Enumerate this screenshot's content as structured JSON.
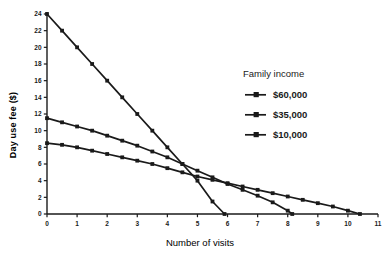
{
  "chart_data": {
    "type": "line",
    "title": "",
    "xlabel": "Number of visits",
    "ylabel": "Day use fee ($)",
    "xlim": [
      0,
      11
    ],
    "ylim": [
      0,
      24
    ],
    "xticks": [
      0,
      1,
      2,
      3,
      4,
      5,
      6,
      7,
      8,
      9,
      10,
      11
    ],
    "xticklabels": [
      "0",
      "1",
      "2",
      "3",
      "4",
      "5",
      "6",
      "7",
      "8",
      "9",
      "10",
      "11"
    ],
    "yticks": [
      0,
      2,
      4,
      6,
      8,
      10,
      12,
      14,
      16,
      18,
      20,
      22,
      24
    ],
    "yticklabels": [
      "0",
      "2",
      "4",
      "6",
      "8",
      "10",
      "12",
      "14",
      "16",
      "18",
      "20",
      "22",
      "24"
    ],
    "grid": false,
    "legend_position": "center-right",
    "legend_title": "Family income",
    "marker": "square",
    "series": [
      {
        "name": "$60,000",
        "x": [
          0,
          0.5,
          1,
          1.5,
          2,
          2.5,
          3,
          3.5,
          4,
          4.5,
          5,
          5.5,
          6,
          6.5,
          7,
          7.5,
          8,
          8.5,
          9,
          9.5,
          10,
          10.4
        ],
        "values": [
          8.5,
          8.3,
          8.0,
          7.6,
          7.2,
          6.8,
          6.4,
          6.0,
          5.5,
          5.0,
          4.5,
          4.1,
          3.7,
          3.3,
          2.9,
          2.5,
          2.1,
          1.7,
          1.3,
          0.9,
          0.4,
          0.0
        ]
      },
      {
        "name": "$35,000",
        "x": [
          0,
          0.5,
          1,
          1.5,
          2,
          2.5,
          3,
          3.5,
          4,
          4.5,
          5,
          5.5,
          6,
          6.5,
          7,
          7.5,
          8,
          8.15
        ],
        "values": [
          11.5,
          11.0,
          10.5,
          10.0,
          9.4,
          8.8,
          8.2,
          7.5,
          6.8,
          6.0,
          5.2,
          4.4,
          3.6,
          2.9,
          2.2,
          1.4,
          0.4,
          0.0
        ]
      },
      {
        "name": "$10,000",
        "x": [
          0,
          0.5,
          1,
          1.5,
          2,
          2.5,
          3,
          3.5,
          4,
          4.5,
          5,
          5.5,
          5.9
        ],
        "values": [
          24.0,
          22.0,
          20.0,
          18.0,
          16.0,
          14.0,
          12.0,
          10.0,
          8.0,
          6.0,
          4.0,
          1.5,
          0.0
        ]
      }
    ]
  },
  "legend": {
    "title": "Family income",
    "entries": [
      {
        "label": "$60,000"
      },
      {
        "label": "$35,000"
      },
      {
        "label": "$10,000"
      }
    ]
  },
  "axes": {
    "x_title": "Number of visits",
    "y_title": "Day use fee ($)"
  },
  "colors": {
    "line": "#1a1a1a",
    "text": "#1a1a1a",
    "background": "#ffffff"
  }
}
